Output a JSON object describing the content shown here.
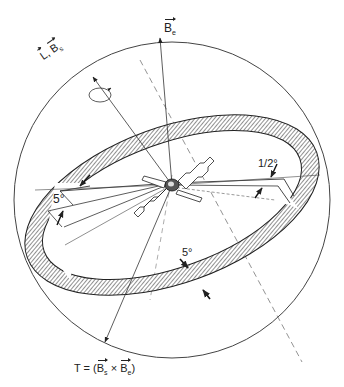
{
  "diagram": {
    "type": "spacecraft attitude geometry",
    "labels": {
      "be_vector": {
        "base": "B",
        "sub": "e"
      },
      "l_bs_vector": {
        "l": "L",
        "sep": ",",
        "base": "B",
        "sub": "s"
      },
      "torque_eq": {
        "prefix": "T = (",
        "b1": "B",
        "s1": "s",
        "op": " × ",
        "b2": "B",
        "s2": "e",
        "suffix": ")"
      },
      "angle_5_left": "5°",
      "angle_half": "1/2°",
      "angle_5_bottom": "5°"
    },
    "colors": {
      "line": "#333333",
      "hatch": "#555555",
      "background": "#ffffff"
    }
  }
}
